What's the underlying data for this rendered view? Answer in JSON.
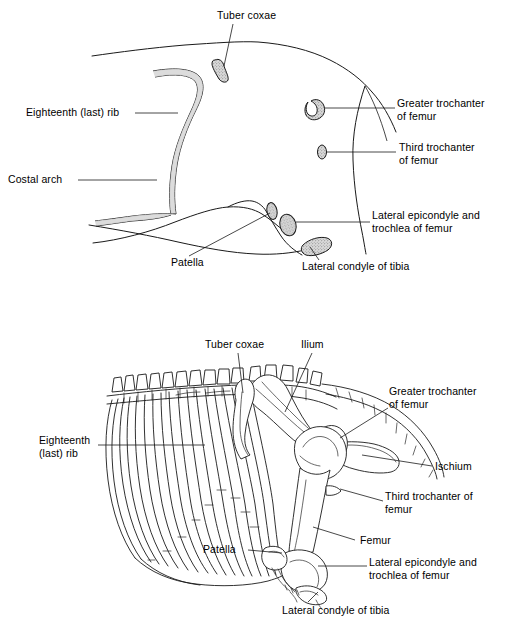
{
  "figure": {
    "panels": [
      {
        "id": "top-panel",
        "name": "surface-contour-panel",
        "description": "Surface outline of the flank with shaded bony landmarks projected on it",
        "labels": [
          {
            "id": "tuber-coxae",
            "text": "Tuber coxae"
          },
          {
            "id": "eighteenth-last-rib",
            "text": "Eighteenth (last) rib"
          },
          {
            "id": "costal-arch",
            "text": "Costal arch"
          },
          {
            "id": "greater-trochanter-of-femur",
            "text": "Greater trochanter\nof femur"
          },
          {
            "id": "third-trochanter-of-femur",
            "text": "Third trochanter\nof femur"
          },
          {
            "id": "lateral-epicondyle-and-trochlea-of-femur",
            "text": "Lateral epicondyle and\ntrochlea of femur"
          },
          {
            "id": "patella",
            "text": "Patella"
          },
          {
            "id": "lateral-condyle-of-tibia",
            "text": "Lateral condyle of tibia"
          }
        ]
      },
      {
        "id": "bottom-panel",
        "name": "skeleton-panel",
        "description": "Skeleton of the caudal thorax, lumbar spine, pelvis and pelvic limb",
        "labels": [
          {
            "id": "tuber-coxae",
            "text": "Tuber coxae"
          },
          {
            "id": "ilium",
            "text": "Ilium"
          },
          {
            "id": "greater-trochanter-of-femur",
            "text": "Greater trochanter\nof femur"
          },
          {
            "id": "ischium",
            "text": "Ischium"
          },
          {
            "id": "eighteenth-last-rib",
            "text": "Eighteenth\n(last) rib"
          },
          {
            "id": "third-trochanter-of-femur",
            "text": "Third trochanter of\nfemur"
          },
          {
            "id": "femur",
            "text": "Femur"
          },
          {
            "id": "lateral-epicondyle-and-trochlea-of-femur",
            "text": "Lateral epicondyle and\ntrochlea of femur"
          },
          {
            "id": "patella",
            "text": "Patella"
          },
          {
            "id": "lateral-condyle-of-tibia",
            "text": "Lateral condyle of tibia"
          }
        ]
      }
    ]
  },
  "top": {
    "tuber_coxae": "Tuber coxae",
    "eighteenth_rib": "Eighteenth (last) rib",
    "costal_arch": "Costal arch",
    "greater_trochanter_l1": "Greater trochanter",
    "greater_trochanter_l2": "of femur",
    "third_trochanter_l1": "Third trochanter",
    "third_trochanter_l2": "of femur",
    "lateral_epicondyle_l1": "Lateral epicondyle and",
    "lateral_epicondyle_l2": "trochlea of femur",
    "patella": "Patella",
    "lateral_condyle_tibia": "Lateral condyle of tibia"
  },
  "bottom": {
    "tuber_coxae": "Tuber coxae",
    "ilium": "Ilium",
    "greater_trochanter_l1": "Greater trochanter",
    "greater_trochanter_l2": "of femur",
    "ischium": "Ischium",
    "eighteenth_rib_l1": "Eighteenth",
    "eighteenth_rib_l2": "(last) rib",
    "third_trochanter_l1": "Third trochanter of",
    "third_trochanter_l2": "femur",
    "femur": "Femur",
    "lateral_epicondyle_l1": "Lateral epicondyle and",
    "lateral_epicondyle_l2": "trochlea of femur",
    "patella": "Patella",
    "lateral_condyle_tibia": "Lateral condyle of tibia"
  },
  "colors": {
    "ink": "#1a1a1a",
    "paper": "#ffffff",
    "bone_shade": "#d8d8d8"
  }
}
